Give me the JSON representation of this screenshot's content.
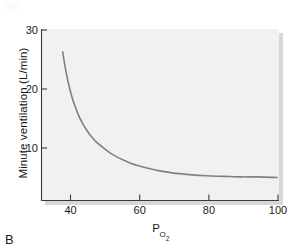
{
  "panel": {
    "label": "B"
  },
  "colors": {
    "plot_background": "#eeeeee",
    "plot_background_light": "#f3f3f3",
    "axis_line": "#3a3a3a",
    "curve": "#808080",
    "shadow": "#d8d8d8",
    "text": "#1a1a1a",
    "page_background": "#ffffff"
  },
  "axis": {
    "y_title": "Minute ventilation (L/min)",
    "x_title_main": "P",
    "x_title_sub": "O",
    "x_title_sub2": "2",
    "y_ticks": [
      "10",
      "20",
      "30"
    ],
    "x_ticks": [
      "40",
      "60",
      "80",
      "100"
    ]
  },
  "chart_data": {
    "type": "line",
    "title": "",
    "subtitle": "",
    "xlabel": "PO2",
    "ylabel": "Minute ventilation (L/min)",
    "xlim": [
      32,
      101
    ],
    "ylim": [
      0,
      30
    ],
    "xticks": [
      40,
      60,
      80,
      100
    ],
    "yticks": [
      10,
      20,
      30
    ],
    "grid": false,
    "legend": null,
    "legend_position": "none",
    "annotations": [],
    "series": [
      {
        "name": "Minute ventilation vs PO2",
        "color": "#808080",
        "linewidth": 1.6,
        "x": [
          38.3,
          39.0,
          40.0,
          41.0,
          42.0,
          43.0,
          44.0,
          45.0,
          46.0,
          47.0,
          48.0,
          50.0,
          52.0,
          54.0,
          56.0,
          58.0,
          60.0,
          63.0,
          66.0,
          70.0,
          75.0,
          80.0,
          85.0,
          90.0,
          95.0,
          100.5
        ],
        "y": [
          26.0,
          23.4,
          20.4,
          18.1,
          16.3,
          14.8,
          13.6,
          12.6,
          11.7,
          11.0,
          10.3,
          9.3,
          8.4,
          7.7,
          7.1,
          6.6,
          6.2,
          5.7,
          5.3,
          4.9,
          4.6,
          4.4,
          4.3,
          4.2,
          4.2,
          4.1
        ]
      }
    ]
  }
}
